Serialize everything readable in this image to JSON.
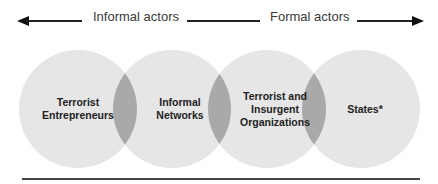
{
  "header": {
    "left_label": "Informal actors",
    "right_label": "Formal actors",
    "left_arrow_icon": "arrow-left-icon",
    "right_arrow_icon": "arrow-right-icon"
  },
  "circles": [
    {
      "label_lines": [
        "Terrorist",
        "Entrepreneurs"
      ]
    },
    {
      "label_lines": [
        "Informal",
        "Networks"
      ]
    },
    {
      "label_lines": [
        "Terrorist and",
        "Insurgent",
        "Organizations"
      ]
    },
    {
      "label_lines": [
        "States*"
      ]
    }
  ],
  "colors": {
    "circle_fill": "#e6e6e6",
    "overlap_fill": "#a9a9a9",
    "text": "#222222"
  }
}
